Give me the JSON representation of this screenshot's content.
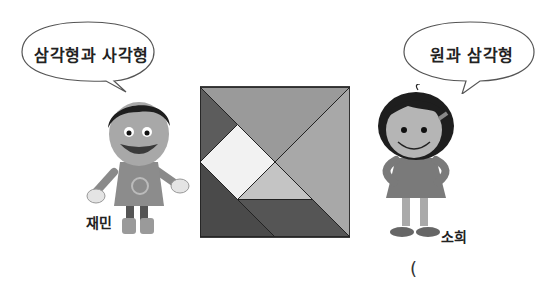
{
  "left_character": {
    "name": "재민",
    "speech": "삼각형과 사각형"
  },
  "right_character": {
    "name": "소희",
    "speech": "원과 삼각형"
  },
  "tangram": {
    "colors": {
      "large_triangle_top": "#9a9a9a",
      "large_triangle_right": "#a8a8a8",
      "small_triangle_top_left": "#5c5c5c",
      "square": "#f2f2f2",
      "small_triangle_center": "#c4c4c4",
      "parallelogram_bottom_left": "#4a4a4a",
      "triangle_bottom": "#555555"
    }
  },
  "answer_paren": "("
}
